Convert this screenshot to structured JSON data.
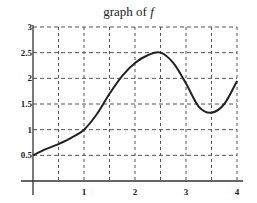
{
  "chart_data": {
    "type": "line",
    "title": "graph of f",
    "title_prefix": "graph of",
    "title_var": "f",
    "xlabel": "",
    "ylabel": "",
    "xlim": [
      0,
      4
    ],
    "ylim": [
      0,
      3
    ],
    "grid": true,
    "grid_style": "dashed",
    "x_ticks": [
      1,
      2,
      3,
      4
    ],
    "x_tick_labels": [
      "1",
      "2",
      "3",
      "4"
    ],
    "y_ticks": [
      0.5,
      1,
      1.5,
      2,
      2.5,
      3
    ],
    "y_tick_labels": [
      "0.5",
      "1",
      "1.5",
      "2",
      "2.5",
      "3"
    ],
    "series": [
      {
        "name": "f",
        "x": [
          0,
          0.25,
          0.5,
          0.75,
          1,
          1.25,
          1.5,
          1.75,
          2,
          2.25,
          2.5,
          2.75,
          3,
          3.25,
          3.5,
          3.75,
          4
        ],
        "y": [
          0.5,
          0.62,
          0.72,
          0.84,
          1.0,
          1.3,
          1.7,
          2.05,
          2.3,
          2.45,
          2.5,
          2.3,
          1.9,
          1.45,
          1.33,
          1.5,
          1.95
        ]
      }
    ],
    "line_color": "#222222"
  }
}
